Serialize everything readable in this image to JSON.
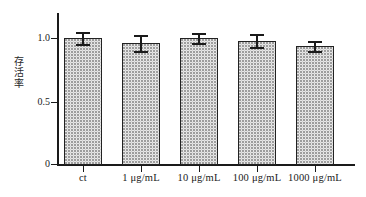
{
  "chart_data": {
    "type": "bar",
    "title": "",
    "subtitle": "",
    "xlabel": "",
    "ylabel": "存活率",
    "categories": [
      "ct",
      "1 μg/mL",
      "10 μg/mL",
      "100 μg/mL",
      "1000 μg/mL"
    ],
    "values": [
      1.0,
      0.96,
      1.0,
      0.98,
      0.94
    ],
    "errors": [
      0.05,
      0.06,
      0.04,
      0.05,
      0.04
    ],
    "series": [
      {
        "name": "存活率",
        "values": [
          1.0,
          0.96,
          1.0,
          0.98,
          0.94
        ],
        "errors": [
          0.05,
          0.06,
          0.04,
          0.05,
          0.04
        ]
      }
    ],
    "ylim": [
      0,
      1.2
    ],
    "yticks": [
      0,
      0.5,
      1.0
    ],
    "ytick_labels": [
      "0",
      "0.5",
      "1.0"
    ],
    "grid": false,
    "legend": false,
    "legend_position": "none",
    "bar_fill": "dotted-stipple",
    "bar_edge_color": "#222222",
    "axis_color": "#1a1a1a",
    "background_color": "#ffffff"
  },
  "axes": {
    "y_title_chars": [
      "存",
      "活",
      "率"
    ],
    "y_ticks": [
      {
        "label": "1.0",
        "value": 1.0
      },
      {
        "label": "0.5",
        "value": 0.5
      },
      {
        "label": "0",
        "value": 0.0
      }
    ]
  },
  "bars": [
    {
      "label": "ct",
      "value": 1.0,
      "error": 0.05
    },
    {
      "label": "1 μg/mL",
      "value": 0.96,
      "error": 0.06
    },
    {
      "label": "10 μg/mL",
      "value": 1.0,
      "error": 0.04
    },
    {
      "label": "100 μg/mL",
      "value": 0.98,
      "error": 0.05
    },
    {
      "label": "1000 μg/mL",
      "value": 0.94,
      "error": 0.04
    }
  ]
}
